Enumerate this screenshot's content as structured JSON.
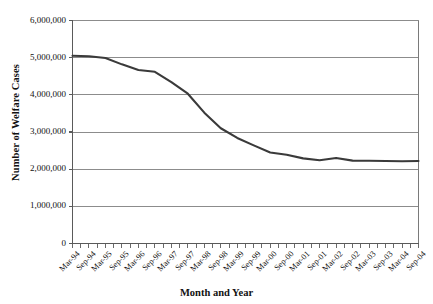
{
  "chart_data": {
    "type": "line",
    "title": "",
    "xlabel": "Month and Year",
    "ylabel": "Number of Welfare Cases",
    "ylim": [
      0,
      6000000
    ],
    "ytick_values": [
      0,
      1000000,
      2000000,
      3000000,
      4000000,
      5000000,
      6000000
    ],
    "ytick_labels": [
      "0",
      "1,000,000",
      "2,000,000",
      "3,000,000",
      "4,000,000",
      "5,000,000",
      "6,000,000"
    ],
    "grid": "horizontal",
    "legend": "none",
    "line_color": "#3a3a3a",
    "grid_color": "#8c8c8c",
    "axis_color": "#7a7a7a",
    "categories": [
      "Mar-94",
      "Sep-94",
      "Mar-95",
      "Sep-95",
      "Mar-96",
      "Sep-96",
      "Mar-97",
      "Sep-97",
      "Mar-98",
      "Sep-98",
      "Mar-99",
      "Sep-99",
      "Mar-00",
      "Sep-00",
      "Mar-01",
      "Sep-01",
      "Mar-02",
      "Sep-02",
      "Mar-03",
      "Sep-03",
      "Mar-04",
      "Sep-04"
    ],
    "series": [
      {
        "name": "Number of Welfare Cases",
        "values": [
          5050000,
          5040000,
          4990000,
          4820000,
          4670000,
          4620000,
          4340000,
          4030000,
          3520000,
          3100000,
          2840000,
          2640000,
          2450000,
          2390000,
          2290000,
          2240000,
          2300000,
          2230000,
          2225000,
          2220000,
          2215000,
          2220000
        ]
      }
    ]
  }
}
